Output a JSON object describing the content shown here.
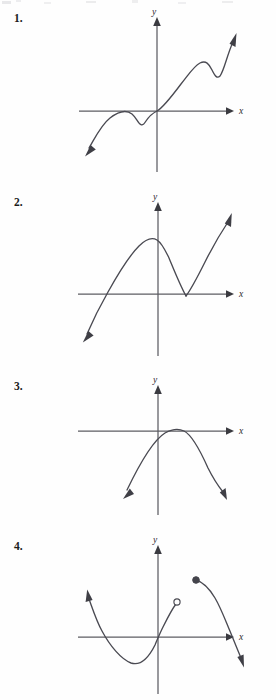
{
  "document": {
    "kind": "worksheet-graph-problems",
    "background_color": "#fefefe",
    "ink_color": "#4a4a52",
    "axis_color": "#5c5c62",
    "label_color": "#2c2c31"
  },
  "problems": [
    {
      "id": "problem-1",
      "number_label": "1.",
      "number_y": 12,
      "graph": {
        "x_axis_label": "x",
        "y_axis_label": "y",
        "origin": {
          "x": 157,
          "y": 111
        },
        "x_axis": {
          "from_x": 79,
          "to_x": 228,
          "arrow": "right"
        },
        "y_axis": {
          "from_y": 172,
          "to_y": 18,
          "arrow": "up"
        },
        "x_label_pos": {
          "x": 240,
          "y": 113
        },
        "y_label_pos": {
          "x": 153,
          "y": 16
        },
        "curve_kind": "wavy-increasing-cubic-quintic",
        "curve_path": "M 89 148 C 95 138 101 125 110 118 C 119 111 127 110 132 114 C 138 119 140 131 146 121 C 150 115 153 113 157 111 C 163 108 172 96 181 84 C 189 74 194 66 200 63 C 206 60 209 64 212 70 C 215 76 217 79 220 76 C 224 71 227 55 233 42",
        "start_arrow": {
          "x": 85,
          "y": 155,
          "angle": 125
        },
        "end_arrow": {
          "x": 236,
          "y": 35,
          "angle": -66
        }
      }
    },
    {
      "id": "problem-2",
      "number_label": "2.",
      "number_y": 196,
      "graph": {
        "x_axis_label": "x",
        "y_axis_label": "y",
        "origin": {
          "x": 158,
          "y": 294
        },
        "x_axis": {
          "from_x": 78,
          "to_x": 228,
          "arrow": "right"
        },
        "y_axis": {
          "from_y": 356,
          "to_y": 202,
          "arrow": "up"
        },
        "x_label_pos": {
          "x": 240,
          "y": 296
        },
        "y_label_pos": {
          "x": 154,
          "y": 200
        },
        "curve_kind": "cubic-with-corner-minimum",
        "curve_path": "M 87 334 C 93 320 100 306 108 292 C 118 274 128 257 139 246 C 146 239 152 237 157 240 C 162 243 165 250 169 258 C 174 270 180 285 186 296",
        "corner_point": {
          "x": 186,
          "y": 296
        },
        "curve_path_2": "M 186 296 C 192 288 198 276 205 262 C 212 248 220 234 228 222",
        "start_arrow": {
          "x": 83,
          "y": 341,
          "angle": 117
        },
        "end_arrow": {
          "x": 231,
          "y": 216,
          "angle": -60
        }
      }
    },
    {
      "id": "problem-3",
      "number_label": "3.",
      "number_y": 380,
      "graph": {
        "x_axis_label": "x",
        "y_axis_label": "y",
        "origin": {
          "x": 158,
          "y": 431
        },
        "x_axis": {
          "from_x": 78,
          "to_x": 228,
          "arrow": "right"
        },
        "y_axis": {
          "from_y": 515,
          "to_y": 385,
          "arrow": "up"
        },
        "x_label_pos": {
          "x": 240,
          "y": 433
        },
        "y_label_pos": {
          "x": 154,
          "y": 383
        },
        "curve_kind": "downward-parabola-tangent-to-x-axis",
        "vertex": {
          "x": 181,
          "y": 430
        },
        "curve_path": "M 127 490 C 139 465 152 441 165 433 C 172 429 178 428 184 431 C 192 435 200 450 208 468 C 214 480 219 487 223 492",
        "start_arrow": {
          "x": 124,
          "y": 497,
          "angle": 115
        },
        "end_arrow": {
          "x": 226,
          "y": 498,
          "angle": 62
        }
      }
    },
    {
      "id": "problem-4",
      "number_label": "4.",
      "number_y": 540,
      "graph": {
        "x_axis_label": "x",
        "y_axis_label": "y",
        "origin": {
          "x": 158,
          "y": 637
        },
        "x_axis": {
          "from_x": 78,
          "to_x": 228,
          "arrow": "right"
        },
        "y_axis": {
          "from_y": 694,
          "to_y": 545,
          "arrow": "up"
        },
        "x_label_pos": {
          "x": 240,
          "y": 639
        },
        "y_label_pos": {
          "x": 154,
          "y": 543
        },
        "curve_kind": "piecewise-with-removable-discontinuity",
        "left_branch_path": "M 89 599 C 92 607 96 620 102 631 C 110 646 121 659 131 663 C 140 666 148 659 155 645 C 158 638 160 633 163 627 C 168 617 172 609 176 604",
        "left_branch_arrow": {
          "x": 87,
          "y": 592,
          "angle": 159
        },
        "open_circle": {
          "x": 177,
          "y": 602,
          "r": 3.1
        },
        "closed_circle": {
          "x": 196,
          "y": 580,
          "r": 3.3
        },
        "right_branch_path": "M 196 580 C 203 582 209 588 215 598 C 221 608 226 622 232 636 C 236 646 239 653 241 658",
        "right_branch_arrow": {
          "x": 243,
          "y": 664,
          "angle": 63
        }
      }
    }
  ]
}
